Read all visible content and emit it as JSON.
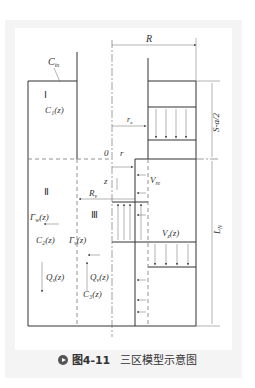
{
  "figure": {
    "caption_number": "图4-11",
    "caption_text": "三区模型示意图"
  },
  "labels": {
    "c_in": "C",
    "c_in_sub": "in",
    "region_1": "Ⅰ",
    "c1": "C₁(z)",
    "R": "R",
    "r_e": "r",
    "r_e_sub": "e",
    "s_a_2": "S-a/2",
    "origin": "0",
    "r": "r",
    "z": "z",
    "v_re": "V",
    "v_re_sub": "re",
    "region_2": "Ⅱ",
    "R_v": "R",
    "R_v_sub": "v",
    "region_3": "Ⅲ",
    "gamma_w": "Γ",
    "gamma_w_sub": "w",
    "gamma_w_arg": "(z)",
    "c2": "C₂(z)",
    "gamma_v": "Γ",
    "gamma_v_sub": "v",
    "gamma_v_arg": "(z)",
    "v_z": "V",
    "v_z_sub": "z",
    "v_z_arg": "(z)",
    "l_n": "L",
    "l_n_sub": "N",
    "q_s": "Q",
    "q_s_sub": "s",
    "q_s_arg": "(z)",
    "q_v": "Q",
    "q_v_sub": "v",
    "q_v_arg": "(z)",
    "c3": "C₃(z)"
  },
  "colors": {
    "line": "#333333",
    "thin": "#666666",
    "card_bg": "#f4f4f4"
  }
}
